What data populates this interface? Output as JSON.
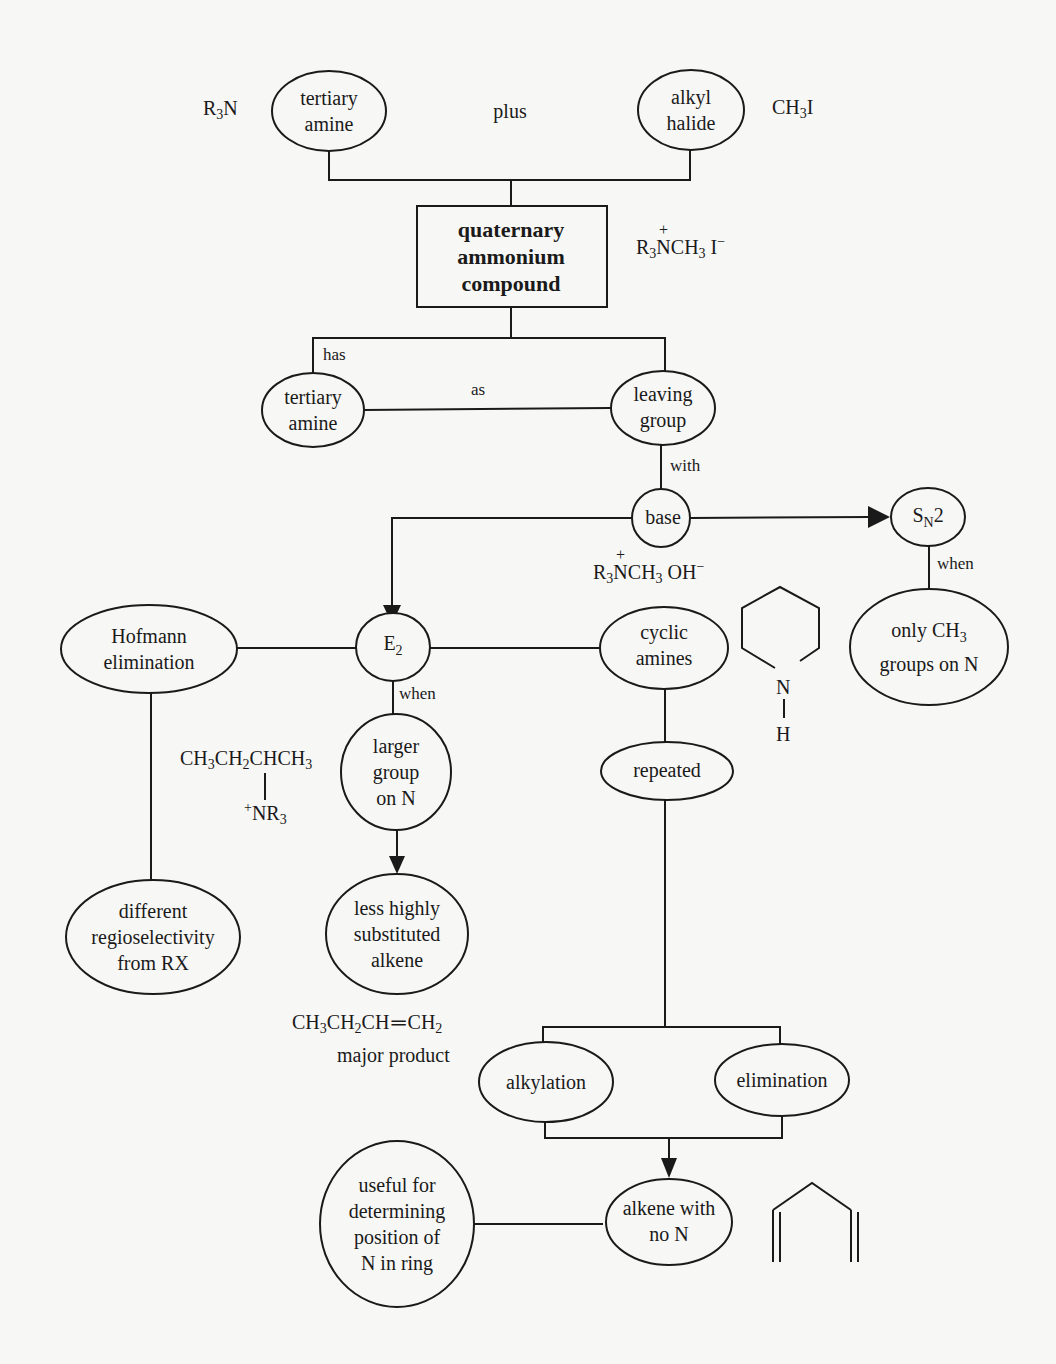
{
  "diagram": {
    "nodes": {
      "tertiary_amine_top": "tertiary\namine",
      "alkyl_halide": "alkyl\nhalide",
      "quaternary": "quaternary\nammonium\ncompound",
      "tertiary_amine_mid": "tertiary\namine",
      "leaving_group": "leaving\ngroup",
      "base": "base",
      "sn2": "S",
      "sn2_sub": "N",
      "sn2_tail": "2",
      "only_ch3_a": "only  CH",
      "only_ch3_sub": "3",
      "only_ch3_b": "groups on N",
      "hofmann": "Hofmann\nelimination",
      "e2": "E",
      "e2_sub": "2",
      "cyclic_amines": "cyclic\namines",
      "larger_group": "larger\ngroup\non N",
      "repeated": "repeated",
      "different_regio": "different\nregioselectivity\nfrom RX",
      "less_substituted": "less highly\nsubstituted\nalkene",
      "alkylation": "alkylation",
      "elimination": "elimination",
      "useful_for": "useful for\ndetermining\nposition of\nN in ring",
      "alkene_no_n": "alkene with\nno N"
    },
    "edge_labels": {
      "plus": "plus",
      "has": "has",
      "as": "as",
      "with": "with",
      "when_sn2": "when",
      "when_e2": "when"
    },
    "formulas": {
      "r3n": {
        "a": "R",
        "s1": "3",
        "b": "N"
      },
      "ch3i": {
        "a": "CH",
        "s1": "3",
        "b": "I"
      },
      "quat_iodide": {
        "a": "R",
        "s1": "3",
        "n": "N",
        "plus": "+",
        "b": "CH",
        "s2": "3",
        "c": " I",
        "sup": "−"
      },
      "quat_hydroxide": {
        "a": "R",
        "s1": "3",
        "n": "N",
        "plus": "+",
        "b": "CH",
        "s2": "3",
        "c": " OH",
        "sup": "−"
      },
      "sec_butyl": {
        "a": "CH",
        "s1": "3",
        "b": "CH",
        "s2": "2",
        "c": "CHCH",
        "s3": "3",
        "nr3_plus": "+",
        "nr3": "NR",
        "nr3_sub": "3"
      },
      "butene": {
        "a": "CH",
        "s1": "3",
        "b": "CH",
        "s2": "2",
        "c": "CH",
        "bond": "═",
        "d": "CH",
        "s3": "2"
      },
      "major_product": "major product",
      "piperidine_n": "N",
      "piperidine_h": "H"
    }
  }
}
